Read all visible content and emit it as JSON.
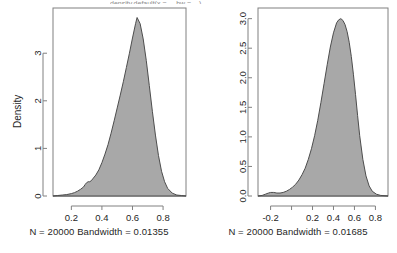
{
  "figure": {
    "truncated_title": "density.default(x =  ...  bw = ...)",
    "background": "#ffffff",
    "fill_color": "#a8a8a8",
    "line_color": "#4d4d4d",
    "axis_color": "#808080"
  },
  "panels": [
    {
      "id": "left",
      "ylabel": "Density",
      "caption": "N = 20000   Bandwidth = 0.01355",
      "chart_data": {
        "type": "area",
        "title": "",
        "xlabel": "",
        "ylabel": "Density",
        "grid": false,
        "legend": "none",
        "xlim": [
          0.08,
          0.95
        ],
        "ylim": [
          0,
          3.95
        ],
        "xticks": [
          0.2,
          0.4,
          0.6,
          0.8
        ],
        "xticklabels": [
          "0.2",
          "0.4",
          "0.6",
          "0.8"
        ],
        "yticks": [
          0,
          1,
          2,
          3
        ],
        "yticklabels": [
          "0",
          "1",
          "2",
          "3"
        ],
        "n": 20000,
        "bandwidth": 0.01355,
        "peak_x": 0.63,
        "peak_y": 3.75,
        "x": [
          0.08,
          0.11,
          0.14,
          0.17,
          0.2,
          0.22,
          0.24,
          0.26,
          0.28,
          0.29,
          0.3,
          0.31,
          0.32,
          0.33,
          0.34,
          0.36,
          0.38,
          0.4,
          0.42,
          0.44,
          0.46,
          0.48,
          0.5,
          0.52,
          0.54,
          0.56,
          0.58,
          0.6,
          0.62,
          0.63,
          0.65,
          0.67,
          0.69,
          0.71,
          0.73,
          0.75,
          0.77,
          0.79,
          0.81,
          0.83,
          0.86,
          0.89,
          0.92,
          0.95
        ],
        "y": [
          0.0,
          0.01,
          0.02,
          0.03,
          0.05,
          0.07,
          0.1,
          0.14,
          0.19,
          0.24,
          0.28,
          0.3,
          0.3,
          0.32,
          0.36,
          0.44,
          0.55,
          0.7,
          0.88,
          1.08,
          1.32,
          1.58,
          1.85,
          2.12,
          2.4,
          2.7,
          3.0,
          3.32,
          3.62,
          3.75,
          3.62,
          3.3,
          2.85,
          2.32,
          1.78,
          1.28,
          0.85,
          0.52,
          0.3,
          0.16,
          0.06,
          0.02,
          0.01,
          0.0
        ]
      }
    },
    {
      "id": "right",
      "ylabel": "Density",
      "caption": "N = 20000   Bandwidth = 0.01685",
      "chart_data": {
        "type": "area",
        "title": "",
        "xlabel": "",
        "ylabel": "Density",
        "grid": false,
        "legend": "none",
        "xlim": [
          -0.32,
          0.92
        ],
        "ylim": [
          0,
          3.18
        ],
        "xticks": [
          -0.2,
          0.0,
          0.2,
          0.4,
          0.6,
          0.8
        ],
        "xticklabels": [
          "-0.2",
          "",
          "0.2",
          "0.4",
          "0.6",
          "0.8"
        ],
        "yticks": [
          0.0,
          0.5,
          1.0,
          1.5,
          2.0,
          2.5,
          3.0
        ],
        "yticklabels": [
          "0.0",
          "0.5",
          "1.0",
          "1.5",
          "2.0",
          "2.5",
          "3.0"
        ],
        "n": 20000,
        "bandwidth": 0.01685,
        "peak_x": 0.47,
        "peak_y": 3.0,
        "x": [
          -0.32,
          -0.28,
          -0.25,
          -0.22,
          -0.2,
          -0.17,
          -0.14,
          -0.11,
          -0.08,
          -0.05,
          -0.02,
          0.01,
          0.04,
          0.07,
          0.1,
          0.13,
          0.16,
          0.19,
          0.22,
          0.25,
          0.28,
          0.31,
          0.34,
          0.37,
          0.4,
          0.43,
          0.45,
          0.47,
          0.49,
          0.51,
          0.53,
          0.55,
          0.57,
          0.59,
          0.61,
          0.63,
          0.65,
          0.68,
          0.71,
          0.74,
          0.77,
          0.81,
          0.85,
          0.92
        ],
        "y": [
          0.0,
          0.01,
          0.03,
          0.05,
          0.06,
          0.06,
          0.05,
          0.05,
          0.06,
          0.08,
          0.11,
          0.15,
          0.2,
          0.27,
          0.36,
          0.47,
          0.62,
          0.8,
          1.02,
          1.28,
          1.58,
          1.9,
          2.22,
          2.52,
          2.76,
          2.93,
          2.98,
          3.0,
          2.97,
          2.9,
          2.78,
          2.6,
          2.36,
          2.06,
          1.72,
          1.36,
          1.02,
          0.62,
          0.34,
          0.17,
          0.08,
          0.03,
          0.01,
          0.0
        ]
      }
    }
  ]
}
